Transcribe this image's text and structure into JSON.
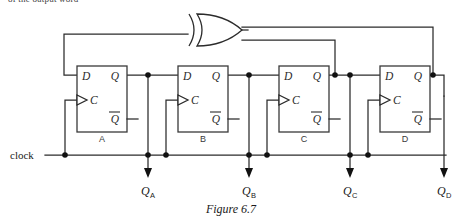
{
  "page": {
    "clipped_top_text": "of the output word",
    "caption": "Figure 6.7",
    "background": "#ffffff",
    "ink_color": "#2b2b2b"
  },
  "circuit": {
    "type": "4-bit linear feedback shift register",
    "clock_label": "clock",
    "gate": {
      "kind": "xor-gate",
      "label": "",
      "inputs": 2,
      "output_feeds": "D of flip-flop A"
    },
    "flipflops": [
      {
        "name": "A",
        "pins": {
          "d": "D",
          "q": "Q",
          "c": "C",
          "qbar": "Q"
        },
        "output_label": "Q",
        "output_sub": "A"
      },
      {
        "name": "B",
        "pins": {
          "d": "D",
          "q": "Q",
          "c": "C",
          "qbar": "Q"
        },
        "output_label": "Q",
        "output_sub": "B"
      },
      {
        "name": "C",
        "pins": {
          "d": "D",
          "q": "Q",
          "c": "C",
          "qbar": "Q"
        },
        "output_label": "Q",
        "output_sub": "C"
      },
      {
        "name": "D",
        "pins": {
          "d": "D",
          "q": "Q",
          "c": "C",
          "qbar": "Q"
        },
        "output_label": "Q",
        "output_sub": "D"
      }
    ],
    "feedback_taps": [
      "Q_C",
      "Q_D"
    ]
  }
}
